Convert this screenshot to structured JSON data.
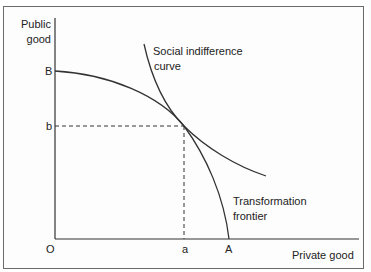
{
  "axes": {
    "y_label_line1": "Public",
    "y_label_line2": "good",
    "x_label": "Private good",
    "origin": "O"
  },
  "points": {
    "B": "B",
    "b": "b",
    "a": "a",
    "A": "A"
  },
  "curves": {
    "indifference_line1": "Social indifference",
    "indifference_line2": "curve",
    "frontier_line1": "Transformation",
    "frontier_line2": "frontier"
  },
  "colors": {
    "line": "#333333",
    "frame": "#6a6a6a"
  }
}
